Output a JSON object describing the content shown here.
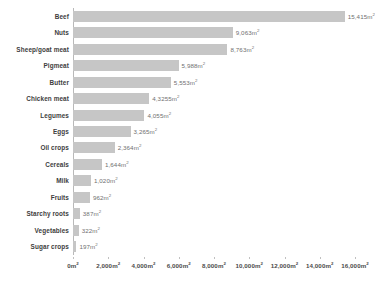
{
  "chart_data": {
    "type": "bar",
    "orientation": "horizontal",
    "title": "",
    "subtitle": "",
    "xlabel": "",
    "ylabel": "",
    "unit": "m²",
    "xlim": [
      0,
      16000
    ],
    "grid": false,
    "legend": null,
    "bar_color": "#c6c6c6",
    "axis_color": "#b9b9b9",
    "label_color": "#3d3d3d",
    "value_color": "#6f6f6f",
    "categories": [
      "Beef",
      "Nuts",
      "Sheep/goat meat",
      "Pigmeat",
      "Butter",
      "Chicken meat",
      "Legumes",
      "Eggs",
      "Oil crops",
      "Cereals",
      "Milk",
      "Fruits",
      "Starchy roots",
      "Vegetables",
      "Sugar crops"
    ],
    "values": [
      15415,
      9063,
      8763,
      5988,
      5553,
      4325.5,
      4055,
      3265,
      2364,
      1644,
      1020,
      962,
      387,
      322,
      197
    ],
    "value_labels": [
      "15,415m²",
      "9,063m²",
      "8,763m²",
      "5,988m²",
      "5,553m²",
      "4,3255m²",
      "4,055m²",
      "3,265m²",
      "2,364m²",
      "1,644m²",
      "1,020m²",
      "962m²",
      "387m²",
      "322m²",
      "197m²"
    ],
    "xticks": [
      0,
      2000,
      4000,
      6000,
      8000,
      10000,
      12000,
      14000,
      16000
    ],
    "xtick_labels": [
      "0m²",
      "2,000m²",
      "4,000m²",
      "6,000m²",
      "8,000m²",
      "10,000m²",
      "12,000m²",
      "14,000m²",
      "16,000m²"
    ]
  }
}
